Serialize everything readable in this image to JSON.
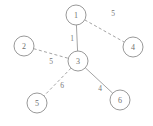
{
  "chart_data": {
    "type": "diagram",
    "diagram_kind": "weighted-graph",
    "title": "",
    "width": 153,
    "height": 126,
    "node_radius": 10,
    "colors": {
      "background": "#ffffff",
      "node_fill": "#ffffff",
      "node_stroke": "#8d8d8d",
      "edge_stroke": "#9a9a9a",
      "label_text": "#6f6f6f",
      "weight_text": "#777777"
    },
    "nodes": [
      {
        "id": "1",
        "label": "1",
        "x": 76,
        "y": 15
      },
      {
        "id": "2",
        "label": "2",
        "x": 24,
        "y": 46
      },
      {
        "id": "3",
        "label": "3",
        "x": 78,
        "y": 61
      },
      {
        "id": "4",
        "label": "4",
        "x": 133,
        "y": 47
      },
      {
        "id": "5",
        "label": "5",
        "x": 37,
        "y": 103
      },
      {
        "id": "6",
        "label": "6",
        "x": 120,
        "y": 100
      }
    ],
    "edges": [
      {
        "source": "1",
        "target": "3",
        "weight": "1",
        "style": "solid",
        "label_x": 72,
        "label_y": 38
      },
      {
        "source": "1",
        "target": "4",
        "weight": "5",
        "style": "dashed",
        "label_x": 113,
        "label_y": 13
      },
      {
        "source": "2",
        "target": "3",
        "weight": "5",
        "style": "dashed",
        "label_x": 51,
        "label_y": 61
      },
      {
        "source": "3",
        "target": "5",
        "weight": "6",
        "style": "dashed",
        "label_x": 62,
        "label_y": 85
      },
      {
        "source": "3",
        "target": "6",
        "weight": "4",
        "style": "solid",
        "label_x": 100,
        "label_y": 88
      }
    ]
  }
}
